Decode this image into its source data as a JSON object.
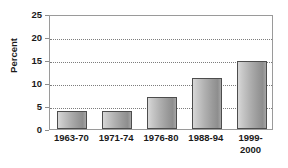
{
  "chart_data": {
    "type": "bar",
    "title": "",
    "subtitle": "",
    "xlabel": "",
    "ylabel": "Percent",
    "categories": [
      "1963-70",
      "1971-74",
      "1976-80",
      "1988-94",
      "1999-2000"
    ],
    "values": [
      4.0,
      4.0,
      7.0,
      11.0,
      14.7
    ],
    "series": [
      {
        "name": "Percent",
        "values": [
          4.0,
          4.0,
          7.0,
          11.0,
          14.7
        ]
      }
    ],
    "ylim": [
      0,
      25
    ],
    "yticks": [
      0,
      5,
      10,
      15,
      20,
      25
    ],
    "ytick_labels": [
      "0",
      "5",
      "10",
      "15",
      "20",
      "25"
    ],
    "grid": true,
    "grid_style": "dotted-horizontal",
    "legend": false,
    "legend_position": "none",
    "bar_fill": "#b0b0b0",
    "bar_border": "#4d4d4d",
    "grid_color": "#7d7d7d",
    "axis_color": "#9a9a9a",
    "text_color": "#1a1a1a",
    "background": "#ffffff"
  },
  "axis": {
    "y_title": "Percent",
    "ticks": [
      {
        "label": "25",
        "value": 25
      },
      {
        "label": "20",
        "value": 20
      },
      {
        "label": "15",
        "value": 15
      },
      {
        "label": "10",
        "value": 10
      },
      {
        "label": "5",
        "value": 5
      },
      {
        "label": "0",
        "value": 0
      }
    ]
  },
  "bars": [
    {
      "label": "1963-70",
      "label_line1": "1963-70",
      "label_line2": "",
      "value": 4.0
    },
    {
      "label": "1971-74",
      "label_line1": "1971-74",
      "label_line2": "",
      "value": 4.0
    },
    {
      "label": "1976-80",
      "label_line1": "1976-80",
      "label_line2": "",
      "value": 7.0
    },
    {
      "label": "1988-94",
      "label_line1": "1988-94",
      "label_line2": "",
      "value": 11.0
    },
    {
      "label": "1999-2000",
      "label_line1": "1999-",
      "label_line2": "2000",
      "value": 14.7
    }
  ]
}
